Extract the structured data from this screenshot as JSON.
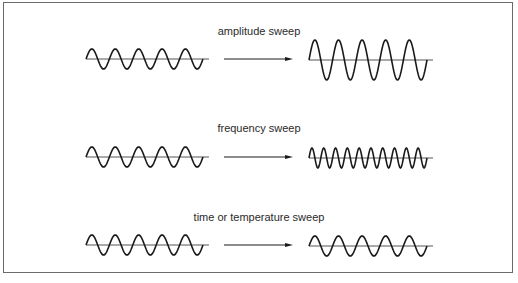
{
  "diagram": {
    "rows": [
      {
        "label": "amplitude sweep",
        "input_wave": {
          "cycles": 5,
          "amplitude": 10
        },
        "output_wave": {
          "cycles": 5,
          "amplitude": 20
        }
      },
      {
        "label": "frequency sweep",
        "input_wave": {
          "cycles": 5,
          "amplitude": 10
        },
        "output_wave": {
          "cycles": 10,
          "amplitude": 10
        }
      },
      {
        "label": "time or temperature sweep",
        "input_wave": {
          "cycles": 5,
          "amplitude": 10
        },
        "output_wave": {
          "cycles": 5,
          "amplitude": 10
        }
      }
    ],
    "colors": {
      "line": "#1a1a1a",
      "axis": "#555555",
      "border": "#6a6a6a"
    }
  }
}
